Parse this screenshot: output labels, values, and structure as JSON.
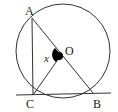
{
  "diagram": {
    "type": "circle-geometry",
    "circle": {
      "center_label": "O"
    },
    "points": [
      {
        "label": "A"
      },
      {
        "label": "B"
      },
      {
        "label": "C"
      },
      {
        "label": "O"
      }
    ],
    "segments": [
      "AC",
      "AB",
      "CO",
      "CB"
    ],
    "tangent_at": "C",
    "angle": {
      "label": "x",
      "vertex": "O",
      "between": [
        "OC",
        "OA"
      ]
    },
    "colors": {
      "stroke": "#333333",
      "fill_marker": "#000000"
    }
  },
  "labels": {
    "A": "A",
    "B": "B",
    "C": "C",
    "O": "O",
    "x": "x"
  }
}
